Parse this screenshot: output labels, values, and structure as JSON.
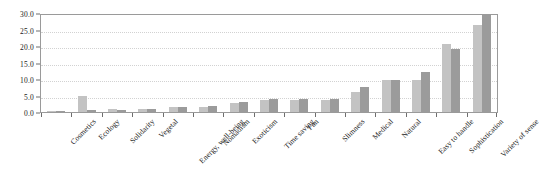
{
  "chart_data": {
    "type": "bar",
    "title": "",
    "subtitle": "",
    "xlabel": "",
    "ylabel": "",
    "ylim": [
      0,
      30
    ],
    "ytick_step": 5,
    "ytick_labels": [
      "0.0",
      "5.0",
      "10.0",
      "15.0",
      "20.0",
      "25.0",
      "30.0"
    ],
    "ytick_values": [
      0,
      5,
      10,
      15,
      20,
      25,
      30
    ],
    "grid": true,
    "grid_axis": "y",
    "legend": false,
    "legend_position": "none",
    "bar_mode": "grouped",
    "categories": [
      "Cosmetics",
      "Ecology",
      "Solidarity",
      "Vegetal",
      "Energy, well-being",
      "Nomadism",
      "Exoticism",
      "Time saving",
      "Fun",
      "Slimness",
      "Medical",
      "Natural",
      "Easy to handle",
      "Sophistication",
      "Variety of sense"
    ],
    "series": [
      {
        "name": "Series 1",
        "color": "#c3c3c3",
        "values": [
          0.3,
          5.0,
          0.8,
          0.8,
          1.5,
          1.6,
          2.6,
          3.6,
          3.5,
          3.5,
          6.0,
          9.8,
          9.8,
          20.5,
          26.5
        ]
      },
      {
        "name": "Series 2",
        "color": "#9b9b9b",
        "values": [
          0.3,
          0.5,
          0.5,
          0.8,
          1.6,
          1.7,
          3.0,
          4.0,
          4.0,
          4.0,
          7.5,
          9.8,
          12.0,
          19.0,
          29.5
        ]
      }
    ]
  },
  "axis": {
    "y_axis_name": "value-axis",
    "x_axis_name": "category-axis"
  }
}
